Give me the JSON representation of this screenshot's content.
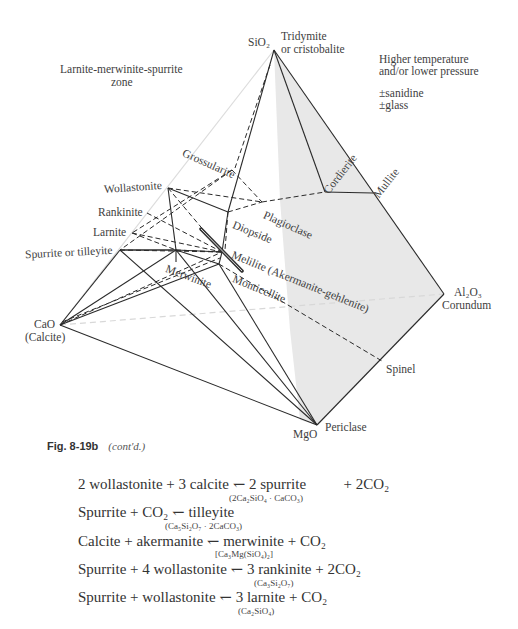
{
  "diagram": {
    "vertices": {
      "sio2": {
        "formula": "SiO₂",
        "mineral_line1": "Tridymite",
        "mineral_line2": "or cristobalite"
      },
      "al2o3": {
        "formula": "Al₂O₃",
        "mineral": "Corundum"
      },
      "mgo": {
        "formula": "MgO",
        "mineral": "Periclase"
      },
      "cao": {
        "formula": "CaO",
        "mineral": "(Calcite)"
      }
    },
    "zone_label_line1": "Larnite-merwinite-spurrite",
    "zone_label_line2": "zone",
    "conditions_line1": "Higher temperature",
    "conditions_line2": "and/or lower pressure",
    "extra1": "±sanidine",
    "extra2": "±glass",
    "phases": {
      "grossularite": "Grossularite",
      "wollastonite": "Wollastonite",
      "rankinite": "Rankinite",
      "larnite": "Larnite",
      "spurrite": "Spurrite or tilleyite",
      "merwinite": "Merwinite",
      "diopside": "Diopside",
      "plagioclase": "Plagioclase",
      "melilite": "Melilite (Akermanite-gehlenite)",
      "monticellite": "Monticellite",
      "cordierite": "Cordierite",
      "mullite": "Mullite",
      "spinel": "Spinel"
    },
    "colors": {
      "line": "#2a2a2a",
      "shade": "#e6e6e6",
      "faint": "#d8d8d8"
    }
  },
  "caption": {
    "figure": "Fig. 8-19b",
    "note": "(cont'd.)"
  },
  "reactions": [
    {
      "equation": "2 wollastonite + 3 calcite ↽ 2 spurrite    + 2CO₂",
      "formula": "(2Ca₂SiO₄ · CaCO₃)"
    },
    {
      "equation": "Spurrite + CO₂ ↽ tilleyite",
      "formula": "(Ca₅Si₂O₇ · 2CaCO₃)"
    },
    {
      "equation": "Calcite + akermanite ↽ merwinite + CO₂",
      "formula": "[Ca₃Mg(SiO₄)₂]"
    },
    {
      "equation": "Spurrite + 4 wollastonite ↽ 3 rankinite + 2CO₂",
      "formula": "(Ca₃Si₂O₇)"
    },
    {
      "equation": "Spurrite + wollastonite ↽ 3 larnite + CO₂",
      "formula": "(Ca₂SiO₄)"
    }
  ]
}
